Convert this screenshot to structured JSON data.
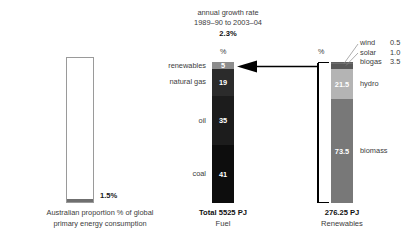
{
  "header": {
    "line1": "annual growth rate",
    "line2": "1989–90 to 2003–04",
    "rate": "2.3%"
  },
  "percent_caption_fuel": "%",
  "percent_caption_renewables": "%",
  "left_panel": {
    "value_label": "1.5%",
    "caption_line1": "Australian proportion % of global",
    "caption_line2": "primary energy consumption",
    "fill_percent": 1.5
  },
  "fuel_panel": {
    "total_label": "Total 5525 PJ",
    "axis_label": "Fuel"
  },
  "renewables_panel": {
    "total_label": "276.25 PJ",
    "axis_label": "Renewables"
  },
  "chart_data": {
    "type": "bar",
    "charts": [
      {
        "name": "australian-share",
        "type": "bar",
        "categories": [
          "Australian share of global primary energy consumption"
        ],
        "values": [
          1.5
        ],
        "ylim": [
          0,
          100
        ],
        "ylabel": "%",
        "annotation": "1.5%"
      },
      {
        "name": "fuel-mix",
        "type": "bar",
        "stacked": true,
        "ylabel": "%",
        "ylim": [
          0,
          100
        ],
        "total": "Total 5525 PJ",
        "categories": [
          "renewables",
          "natural gas",
          "oil",
          "coal"
        ],
        "values": [
          5,
          19,
          35,
          41
        ],
        "segments": [
          {
            "label": "renewables",
            "value": 5,
            "value_text": "5",
            "color": "#8c8c8c",
            "text_color": "#ffffff"
          },
          {
            "label": "natural gas",
            "value": 19,
            "value_text": "19",
            "color": "#2b2b2b",
            "text_color": "#ffffff"
          },
          {
            "label": "oil",
            "value": 35,
            "value_text": "35",
            "color": "#1c1c1c",
            "text_color": "#ffffff"
          },
          {
            "label": "coal",
            "value": 41,
            "value_text": "41",
            "color": "#0d0d0d",
            "text_color": "#ffffff"
          }
        ]
      },
      {
        "name": "renewables-mix",
        "type": "bar",
        "stacked": true,
        "ylabel": "%",
        "ylim": [
          0,
          100
        ],
        "total": "276.25 PJ",
        "categories": [
          "wind",
          "solar",
          "biogas",
          "hydro",
          "biomass"
        ],
        "values": [
          0.5,
          1.0,
          3.5,
          21.5,
          73.5
        ],
        "segments": [
          {
            "label": "wind",
            "value": 0.5,
            "value_text": "0.5",
            "color": "#5f5f5f",
            "text_color": "#ffffff",
            "show_value_inside": false
          },
          {
            "label": "solar",
            "value": 1.0,
            "value_text": "1.0",
            "color": "#6e6e6e",
            "text_color": "#ffffff",
            "show_value_inside": false
          },
          {
            "label": "biogas",
            "value": 3.5,
            "value_text": "3.5",
            "color": "#595959",
            "text_color": "#ffffff",
            "show_value_inside": false
          },
          {
            "label": "hydro",
            "value": 21.5,
            "value_text": "21.5",
            "color": "#b4b4b4",
            "text_color": "#ffffff",
            "show_value_inside": true
          },
          {
            "label": "biomass",
            "value": 73.5,
            "value_text": "73.5",
            "color": "#787878",
            "text_color": "#ffffff",
            "show_value_inside": true
          }
        ]
      }
    ],
    "growth_rate_note": {
      "line1": "annual growth rate",
      "line2": "1989–90 to 2003–04",
      "value": "2.3%"
    },
    "connector": "arrow from renewables breakdown bar to renewables segment of fuel bar"
  },
  "colors": {
    "renewables_seg": "#8c8c8c",
    "natural_gas_seg": "#2b2b2b",
    "oil_seg": "#1c1c1c",
    "coal_seg": "#0d0d0d",
    "hydro_seg": "#b4b4b4",
    "biomass_seg": "#787878",
    "aus_fill": "#6f6f6f",
    "line": "#000000",
    "text": "#3b3b3b"
  }
}
